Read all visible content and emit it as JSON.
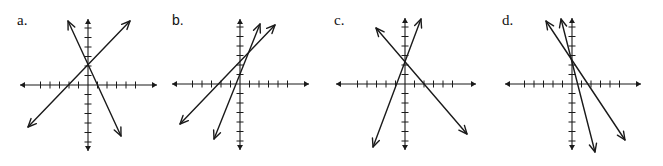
{
  "graphs": [
    {
      "label": "a.",
      "origin": [
        88,
        85
      ],
      "unit_px": 9.5,
      "x_axis": {
        "from": 20,
        "to": 157,
        "ticks_neg": 5,
        "ticks_pos": 5
      },
      "y_axis": {
        "from": 19,
        "to": 151,
        "ticks_neg": 6,
        "ticks_pos": 6
      },
      "lines": [
        {
          "name": "positive-slope-line",
          "p1": [
            28,
            127
          ],
          "p2": [
            130,
            21
          ]
        },
        {
          "name": "negative-slope-line",
          "p1": [
            68,
            21
          ],
          "p2": [
            121,
            136
          ]
        }
      ],
      "intersection": [
        88,
        63
      ]
    },
    {
      "label": "b.",
      "origin": [
        240,
        84
      ],
      "unit_px": 9.5,
      "x_axis": {
        "from": 172,
        "to": 309,
        "ticks_neg": 5,
        "ticks_pos": 5
      },
      "y_axis": {
        "from": 19,
        "to": 150,
        "ticks_neg": 6,
        "ticks_pos": 6
      },
      "lines": [
        {
          "name": "steep-positive-line",
          "p1": [
            214,
            139
          ],
          "p2": [
            260,
            24
          ]
        },
        {
          "name": "shallow-positive-line",
          "p1": [
            180,
            124
          ],
          "p2": [
            275,
            25
          ]
        }
      ],
      "intersection": [
        247,
        56
      ]
    },
    {
      "label": "c.",
      "origin": [
        405,
        84
      ],
      "unit_px": 9.5,
      "x_axis": {
        "from": 336,
        "to": 476,
        "ticks_neg": 5,
        "ticks_pos": 5
      },
      "y_axis": {
        "from": 18,
        "to": 150,
        "ticks_neg": 6,
        "ticks_pos": 6
      },
      "lines": [
        {
          "name": "positive-slope-line",
          "p1": [
            373,
            147
          ],
          "p2": [
            421,
            19
          ]
        },
        {
          "name": "negative-slope-line",
          "p1": [
            376,
            28
          ],
          "p2": [
            467,
            134
          ]
        }
      ],
      "intersection": [
        406,
        61
      ]
    },
    {
      "label": "d.",
      "origin": [
        572,
        84
      ],
      "unit_px": 9.5,
      "x_axis": {
        "from": 505,
        "to": 641,
        "ticks_neg": 5,
        "ticks_pos": 5
      },
      "y_axis": {
        "from": 18,
        "to": 150,
        "ticks_neg": 6,
        "ticks_pos": 6
      },
      "lines": [
        {
          "name": "shallow-negative-line",
          "p1": [
            546,
            21
          ],
          "p2": [
            625,
            140
          ]
        },
        {
          "name": "steep-negative-line",
          "p1": [
            561,
            19
          ],
          "p2": [
            595,
            152
          ]
        }
      ],
      "intersection": [
        573,
        61
      ]
    }
  ],
  "label_positions": [
    [
      17,
      14
    ],
    [
      172,
      14
    ],
    [
      334,
      14
    ],
    [
      502,
      14
    ]
  ],
  "colors": {
    "ink": "#1a1a1a",
    "background": "#ffffff"
  }
}
